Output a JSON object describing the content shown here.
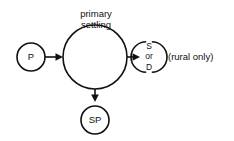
{
  "diagram": {
    "title_label": {
      "line1": "primary",
      "line2": "settling"
    },
    "nodes": [
      {
        "id": "primary-influent",
        "label": "P",
        "shape": "circle"
      },
      {
        "id": "primary-settling",
        "label": "",
        "shape": "circle"
      },
      {
        "id": "sludge-outlet",
        "shape": "open-arcs",
        "line1": "S",
        "line2": "or",
        "line3": "D"
      },
      {
        "id": "sludge-pump",
        "label": "SP",
        "shape": "circle"
      }
    ],
    "side_note": "(rural only)",
    "colors": {
      "stroke": "#111111",
      "background": "#ffffff",
      "text": "#111111"
    }
  }
}
